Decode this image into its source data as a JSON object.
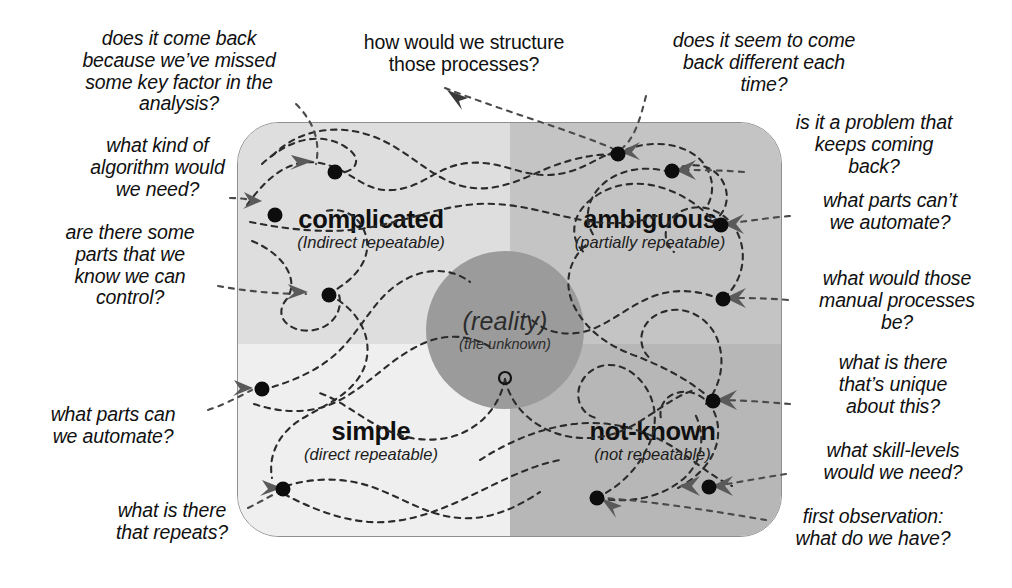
{
  "diagram": {
    "box": {
      "x": 237,
      "y": 122,
      "width": 545,
      "height": 415,
      "corner_radius": 42,
      "border_color": "#8e8e8e"
    },
    "quadrants": [
      {
        "id": "complicated",
        "position": "top-left",
        "title": "complicated",
        "subtitle": "(Indirect repeatable)",
        "fill": "#dedede"
      },
      {
        "id": "ambiguous",
        "position": "top-right",
        "title": "ambiguous",
        "subtitle": "(partially repeatable)",
        "fill": "#c4c4c4"
      },
      {
        "id": "simple",
        "position": "bottom-left",
        "title": "simple",
        "subtitle": "(direct repeatable)",
        "fill": "#efefef"
      },
      {
        "id": "not-known",
        "position": "bottom-right",
        "title": "not-known",
        "subtitle": "(not repeatable)",
        "fill": "#b7b7b7"
      }
    ],
    "center": {
      "label": "(reality)",
      "sublabel": "(the unknown)",
      "fill": "#9b9b9b",
      "cx": 505,
      "cy": 330,
      "r": 79
    },
    "origin_marker": {
      "shape": "open-circle",
      "cx": 505,
      "cy": 378
    },
    "notes": [
      {
        "id": "missed-key-factor",
        "text": "does it come back\nbecause we’ve missed\nsome key factor in the\nanalysis?",
        "align": "center",
        "style": "italic"
      },
      {
        "id": "kind-of-algorithm",
        "text": "what kind of\nalgorithm would\nwe need?",
        "align": "center",
        "style": "italic"
      },
      {
        "id": "parts-we-control",
        "text": "are there some\nparts that we\nknow we can\ncontrol?",
        "align": "center",
        "style": "italic"
      },
      {
        "id": "parts-we-automate",
        "text": "what parts can\nwe automate?",
        "align": "center",
        "style": "italic"
      },
      {
        "id": "what-repeats",
        "text": "what is there\nthat repeats?",
        "align": "center",
        "style": "italic"
      },
      {
        "id": "structure-processes",
        "text": "how would we structure\nthose processes?",
        "align": "center",
        "style": "normal"
      },
      {
        "id": "back-different",
        "text": "does it seem to come\nback different each\ntime?",
        "align": "center",
        "style": "italic"
      },
      {
        "id": "keeps-coming-back",
        "text": "is it a problem that\nkeeps coming\nback?",
        "align": "center",
        "style": "italic"
      },
      {
        "id": "parts-cant-automate",
        "text": "what parts can’t\nwe automate?",
        "align": "center",
        "style": "italic"
      },
      {
        "id": "manual-processes",
        "text": "what would those\nmanual processes\nbe?",
        "align": "center",
        "style": "italic"
      },
      {
        "id": "unique-about-this",
        "text": "what is there\nthat’s unique\nabout this?",
        "align": "center",
        "style": "italic"
      },
      {
        "id": "skill-levels",
        "text": "what skill-levels\nwould we need?",
        "align": "center",
        "style": "italic"
      },
      {
        "id": "first-observation",
        "text": "first observation:\nwhat do we have?",
        "align": "center",
        "style": "italic"
      }
    ]
  }
}
